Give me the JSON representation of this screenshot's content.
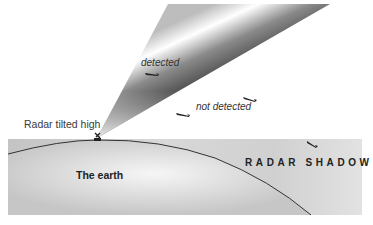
{
  "diagram": {
    "radar_label": "Radar tilted high",
    "detected_label": "detected",
    "not_detected_label": "not detected",
    "earth_label": "The earth",
    "shadow_label": "RADAR  SHADOW",
    "aircraft": [
      {
        "id": "detected-plane",
        "status": "detected"
      },
      {
        "id": "low-plane",
        "status": "not detected"
      },
      {
        "id": "mid-plane",
        "status": "not detected"
      },
      {
        "id": "shadow-plane",
        "status": "in radar shadow"
      }
    ],
    "colors": {
      "ground": "#c8c8c8",
      "beam_dark": "#3a3a3a",
      "curve": "#333333"
    }
  }
}
